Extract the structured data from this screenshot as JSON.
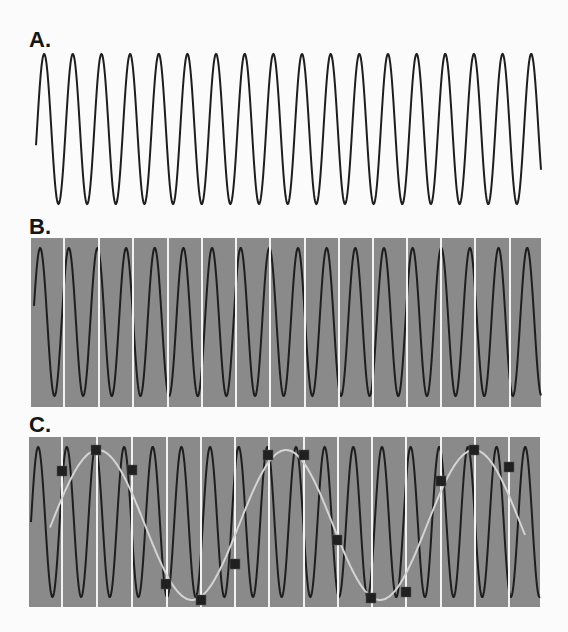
{
  "figure": {
    "colors": {
      "background": "#fbfbfb",
      "wave": "#1e1e1e",
      "panel_fill": "#8a8a8a",
      "sample_line": "#f2f2f2",
      "alias_curve": "#d4d4d4",
      "sample_marker": "#202020"
    },
    "panels": [
      {
        "id": "A",
        "label": "A.",
        "label_pos": [
          29,
          29
        ],
        "box": null,
        "wave": {
          "x_start": 36,
          "x_end": 541,
          "center_y": 129,
          "amplitude": 75,
          "period": 28.65,
          "x_phase0": 37
        },
        "sample_lines": [],
        "samples": [],
        "alias_curve": null
      },
      {
        "id": "B",
        "label": "B.",
        "label_pos": [
          29,
          216
        ],
        "box": {
          "x": 31,
          "y": 238,
          "w": 510,
          "h": 169
        },
        "wave": {
          "x_start": 34,
          "x_end": 541,
          "center_y": 322,
          "amplitude": 74,
          "period": 28.65,
          "x_phase0": 33
        },
        "sample_lines": [
          64,
          99,
          133,
          168,
          202,
          236,
          270,
          305,
          339,
          373,
          407,
          441,
          475,
          510
        ],
        "samples": [],
        "alias_curve": null
      },
      {
        "id": "C",
        "label": "C.",
        "label_pos": [
          29,
          414
        ],
        "box": {
          "x": 29,
          "y": 437,
          "w": 511,
          "h": 170
        },
        "wave": {
          "x_start": 31,
          "x_end": 540,
          "center_y": 522,
          "amplitude": 75,
          "period": 28.65,
          "x_phase0": 31
        },
        "sample_lines": [
          62,
          97,
          132,
          167,
          201,
          235,
          269,
          304,
          338,
          372,
          406,
          441,
          475,
          509
        ],
        "samples": [
          [
            62,
            471
          ],
          [
            96,
            450
          ],
          [
            132,
            470
          ],
          [
            166,
            584
          ],
          [
            201,
            600
          ],
          [
            235,
            564
          ],
          [
            268,
            455
          ],
          [
            304,
            455
          ],
          [
            337,
            540
          ],
          [
            371,
            598
          ],
          [
            406,
            592
          ],
          [
            441,
            481
          ],
          [
            474,
            450
          ],
          [
            509,
            467
          ]
        ],
        "alias_curve": {
          "x_start": 50,
          "x_end": 525,
          "center_y": 525,
          "amplitude": 75,
          "period": 188,
          "x_peak": 98
        }
      }
    ]
  }
}
